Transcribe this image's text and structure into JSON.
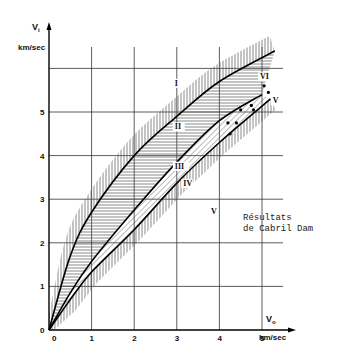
{
  "chart_data": {
    "type": "line",
    "title": "",
    "xlabel": "V0 km/sec",
    "ylabel": "Vi km/sec",
    "x_axis": {
      "symbol": "V",
      "subscript": "o",
      "unit": "km/sec",
      "ticks": [
        "0",
        "1",
        "2",
        "3",
        "4",
        "5"
      ],
      "range": [
        0,
        5.5
      ]
    },
    "y_axis": {
      "symbol": "V",
      "subscript": "i",
      "unit": "km/sec",
      "ticks": [
        "0",
        "1",
        "2",
        "3",
        "4",
        "5"
      ],
      "range": [
        0,
        6.5
      ]
    },
    "grid": true,
    "series": [
      {
        "name": "upper boundary (I / II)",
        "points": [
          [
            0,
            0
          ],
          [
            0.5,
            1.7
          ],
          [
            1,
            2.7
          ],
          [
            2,
            4.0
          ],
          [
            3,
            4.9
          ],
          [
            4,
            5.7
          ],
          [
            5.3,
            6.4
          ]
        ]
      },
      {
        "name": "middle boundary (II / III)",
        "points": [
          [
            0,
            0
          ],
          [
            0.5,
            0.85
          ],
          [
            1,
            1.57
          ],
          [
            2,
            2.75
          ],
          [
            3,
            3.85
          ],
          [
            4,
            4.8
          ],
          [
            5,
            5.4
          ]
        ]
      },
      {
        "name": "lower boundary (III / IV)",
        "points": [
          [
            0,
            0
          ],
          [
            0.5,
            0.7
          ],
          [
            1,
            1.33
          ],
          [
            2,
            2.3
          ],
          [
            3,
            3.37
          ],
          [
            4,
            4.3
          ],
          [
            5.2,
            5.3
          ]
        ]
      }
    ],
    "regions": [
      {
        "label": "I",
        "x": 3.0,
        "y": 5.6
      },
      {
        "label": "II",
        "x": 3.0,
        "y": 4.6
      },
      {
        "label": "III",
        "x": 3.0,
        "y": 3.7
      },
      {
        "label": "IV",
        "x": 3.2,
        "y": 3.3
      },
      {
        "label": "V",
        "x": 3.85,
        "y": 2.65
      },
      {
        "label": "VI",
        "x": 5.0,
        "y": 5.75
      },
      {
        "label": "V",
        "x": 5.3,
        "y": 5.2
      }
    ],
    "scatter": {
      "name": "Résultats de Cabril Dam",
      "points": [
        [
          4.5,
          5.05
        ],
        [
          4.75,
          5.15
        ],
        [
          4.8,
          5.05
        ],
        [
          4.2,
          4.75
        ],
        [
          4.4,
          4.75
        ],
        [
          4.25,
          4.5
        ],
        [
          5.05,
          5.6
        ],
        [
          5.15,
          5.45
        ]
      ]
    },
    "annotations": [
      "Résultats",
      "de Cabril Dam"
    ]
  }
}
